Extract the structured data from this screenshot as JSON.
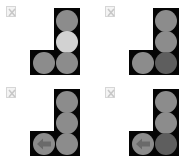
{
  "colors": {
    "housing": "#050505",
    "lamp_off": "#8c8c8c",
    "lamp_lit": "#d2d2d2",
    "lamp_dim": "#5e5e5e",
    "arrow": "#6a6a6a"
  },
  "tiles": [
    {
      "broken_image_icon": "broken-image-icon",
      "lamps": {
        "top": "off",
        "middle": "lit",
        "bottom": "off",
        "left": "off"
      },
      "left_arrow": false
    },
    {
      "broken_image_icon": "broken-image-icon",
      "lamps": {
        "top": "off",
        "middle": "off",
        "bottom": "dim",
        "left": "off"
      },
      "left_arrow": false
    },
    {
      "broken_image_icon": "broken-image-icon",
      "lamps": {
        "top": "off",
        "middle": "off",
        "bottom": "off",
        "left": "off"
      },
      "left_arrow": true
    },
    {
      "broken_image_icon": "broken-image-icon",
      "lamps": {
        "top": "off",
        "middle": "off",
        "bottom": "dim",
        "left": "off"
      },
      "left_arrow": true
    }
  ]
}
